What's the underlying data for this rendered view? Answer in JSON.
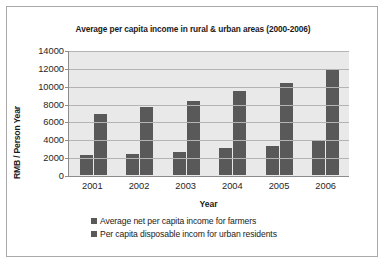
{
  "chart_data": {
    "type": "bar",
    "title": "Average per capita income in rural & urban areas (2000-2006)",
    "xlabel": "Year",
    "ylabel": "RMB / Person Year",
    "categories": [
      "2001",
      "2002",
      "2003",
      "2004",
      "2005",
      "2006"
    ],
    "series": [
      {
        "name": "Average net per capita income for farmers",
        "color": "#595959",
        "values": [
          2200,
          2300,
          2600,
          3000,
          3250,
          3800
        ]
      },
      {
        "name": "Per capita disposable incom for urban residents",
        "color": "#595959",
        "values": [
          6800,
          7650,
          8250,
          9400,
          10250,
          11750
        ]
      }
    ],
    "ylim": [
      0,
      14000
    ],
    "ystep": 2000,
    "yticks": [
      14000,
      12000,
      10000,
      8000,
      6000,
      4000,
      2000,
      0
    ],
    "grid": true,
    "legend_position": "bottom-left",
    "plot_background": "#e9e9e9",
    "gridline_color": "#b4b4b4",
    "frame_border_color": "#a9a9a9"
  }
}
